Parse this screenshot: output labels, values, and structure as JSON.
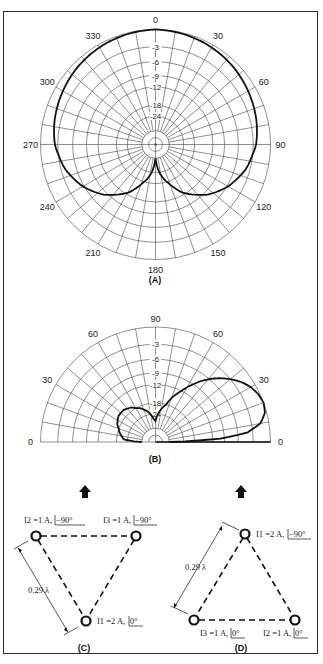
{
  "figure": {
    "border_color": "#2a2a2a",
    "grid_color": "#444444",
    "trace_color": "#111111"
  },
  "chart_data": [
    {
      "id": "A",
      "type": "polar",
      "caption": "(A)",
      "title": "Azimuth pattern",
      "angle_labels": [
        "0",
        "30",
        "60",
        "90",
        "120",
        "150",
        "180",
        "210",
        "240",
        "270",
        "300",
        "330"
      ],
      "radial_labels": [
        "-3",
        "-6",
        "-9",
        "-12",
        "-18",
        "-24"
      ],
      "ring_fractions": [
        1.0,
        0.85,
        0.72,
        0.6,
        0.5,
        0.34,
        0.245,
        0.12,
        0.06
      ],
      "grid_spokes_deg": 10,
      "pattern": {
        "angles_deg": [
          0,
          15,
          30,
          45,
          60,
          75,
          90,
          105,
          120,
          135,
          150,
          165,
          175,
          180
        ],
        "gain_db": [
          0,
          -0.2,
          -0.5,
          -0.9,
          -1.4,
          -1.9,
          -2.5,
          -3.8,
          -5.8,
          -8.5,
          -12.5,
          -19,
          -26,
          -30
        ]
      }
    },
    {
      "id": "B",
      "type": "polar-half",
      "caption": "(B)",
      "title": "Elevation pattern",
      "angle_labels_left": [
        "0",
        "30",
        "60"
      ],
      "angle_labels_right": [
        "0",
        "30",
        "60"
      ],
      "top_label": "90",
      "radial_labels": [
        "-3",
        "-6",
        "-9",
        "-12",
        "-18",
        "-24"
      ],
      "pattern_main": {
        "elev_deg": [
          0,
          3,
          6,
          10,
          15,
          20,
          25,
          30,
          35,
          40,
          45,
          50,
          55,
          60,
          65,
          70,
          75,
          80,
          85,
          90
        ],
        "gain_db": [
          -30,
          -10,
          -4,
          -1.5,
          -0.3,
          0,
          -0.3,
          -0.9,
          -1.8,
          -3.0,
          -4.5,
          -6.2,
          -8.2,
          -10.5,
          -13,
          -15.5,
          -18.5,
          -21,
          -24,
          -27
        ]
      },
      "pattern_back": {
        "elev_deg_from_back": [
          0,
          5,
          15,
          25,
          35,
          45,
          55,
          65,
          75,
          85,
          90
        ],
        "gain_db": [
          -30,
          -22,
          -19,
          -17,
          -16,
          -16,
          -17,
          -19,
          -22,
          -26,
          -27
        ]
      }
    }
  ],
  "arrays": {
    "C": {
      "caption": "(C)",
      "spacing": "0.29 λ",
      "elements": [
        {
          "id": "I2",
          "label": "I2 =1 A,",
          "phase": "−90°"
        },
        {
          "id": "I3",
          "label": "I3 =1 A,",
          "phase": "−90°"
        },
        {
          "id": "I1",
          "label": "I1 =2 A,",
          "phase": "0°"
        }
      ]
    },
    "D": {
      "caption": "(D)",
      "spacing": "0.29 λ",
      "elements": [
        {
          "id": "I1",
          "label": "I1 =2 A,",
          "phase": "−90°"
        },
        {
          "id": "I3",
          "label": "I3 =1 A,",
          "phase": "0°"
        },
        {
          "id": "I2",
          "label": "I2 =1 A,",
          "phase": "0°"
        }
      ]
    }
  }
}
